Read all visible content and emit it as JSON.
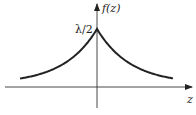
{
  "chart_data": {
    "type": "line",
    "title": "",
    "function": "f(z) = (λ/2) e^(-λ|z|)",
    "xlabel": "z",
    "ylabel": "f(z)",
    "peak_label": "λ/2",
    "peak_value_symbolic": "λ/2",
    "grid": false,
    "legend": null,
    "axes_style": "arrows through origin",
    "series": [
      {
        "name": "f(z)",
        "x": [
          -3,
          -2.5,
          -2,
          -1.5,
          -1,
          -0.5,
          -0.25,
          0,
          0.25,
          0.5,
          1,
          1.5,
          2,
          2.5,
          3
        ],
        "values": [
          0.025,
          0.041,
          0.068,
          0.112,
          0.184,
          0.303,
          0.389,
          0.5,
          0.389,
          0.303,
          0.184,
          0.112,
          0.068,
          0.041,
          0.025
        ]
      }
    ]
  },
  "labels": {
    "y_axis": "f(z)",
    "x_axis": "z",
    "peak": "λ/2"
  }
}
